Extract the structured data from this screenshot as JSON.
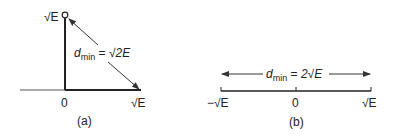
{
  "panel_a": {
    "caption": "(a)",
    "y_point_label": "√E",
    "origin_label": "0",
    "x_point_label": "√E",
    "distance_label": {
      "d": "d",
      "sub": "min",
      "eq": " = ",
      "value": "√2E"
    }
  },
  "panel_b": {
    "caption": "(b)",
    "left_label": "−√E",
    "origin_label": "0",
    "right_label": "√E",
    "distance_label": {
      "d": "d",
      "sub": "min",
      "eq": " = ",
      "value": "2√E"
    }
  },
  "colors": {
    "ink": "#222222",
    "axis": "#333333",
    "background": "#ffffff"
  }
}
